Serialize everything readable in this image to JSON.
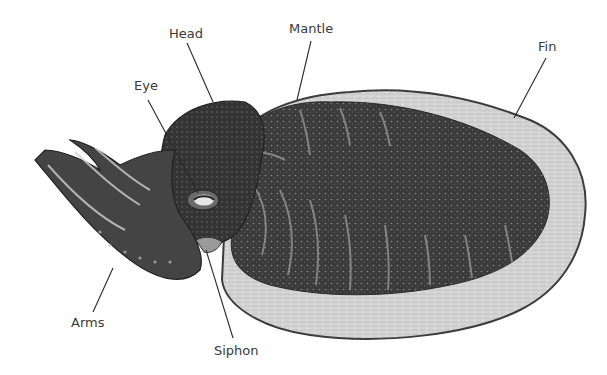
{
  "diagram": {
    "colors": {
      "background": "#ffffff",
      "fin": "#d2d2d2",
      "fin_edge": "#3c3c3c",
      "mantle": "#3d3d3d",
      "head": "#333333",
      "arms": "#4a4a4a",
      "stripe": "#9a9a9a",
      "label": "#3a3a3a",
      "leader": "#2a2a2a"
    },
    "labels": [
      {
        "id": "head",
        "text": "Head",
        "x": 169,
        "y": 38,
        "line": [
          187,
          43,
          213,
          102
        ]
      },
      {
        "id": "mantle",
        "text": "Mantle",
        "x": 289,
        "y": 33,
        "line": [
          311,
          41,
          297,
          100
        ]
      },
      {
        "id": "fin",
        "text": "Fin",
        "x": 538,
        "y": 51,
        "line": [
          546,
          58,
          514,
          118
        ]
      },
      {
        "id": "eye",
        "text": "Eye",
        "x": 134,
        "y": 90,
        "line": [
          148,
          100,
          198,
          193
        ]
      },
      {
        "id": "arms",
        "text": "Arms",
        "x": 71,
        "y": 327,
        "line": [
          93,
          312,
          113,
          268
        ]
      },
      {
        "id": "siphon",
        "text": "Siphon",
        "x": 214,
        "y": 355,
        "line": [
          233,
          338,
          206,
          250
        ]
      }
    ]
  }
}
